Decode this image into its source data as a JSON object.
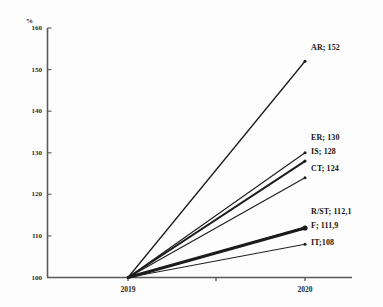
{
  "chart_data": {
    "type": "line",
    "title": "",
    "subtitle": "",
    "xlabel": "",
    "ylabel": "%",
    "x": [
      "2019",
      "2020"
    ],
    "categories": [
      "2019",
      "2020"
    ],
    "xlim": [
      2019,
      2020
    ],
    "ylim": [
      100,
      160
    ],
    "yticks": [
      100,
      110,
      120,
      130,
      140,
      150,
      160
    ],
    "ytick_labels": [
      "100",
      "110",
      "120",
      "130",
      "140",
      "150",
      "160"
    ],
    "xtick_labels": [
      "2019",
      "2020"
    ],
    "grid": false,
    "legend": "right-endpoint-labels",
    "base_index_value": 100,
    "series": [
      {
        "name": "AR",
        "label": "AR; 152",
        "values": [
          100,
          152
        ],
        "end_value": 152,
        "emphasis": "normal"
      },
      {
        "name": "ER",
        "label": "ER; 130",
        "values": [
          100,
          130
        ],
        "end_value": 130,
        "emphasis": "normal"
      },
      {
        "name": "IS",
        "label": "IS; 128",
        "values": [
          100,
          128
        ],
        "end_value": 128,
        "emphasis": "bold"
      },
      {
        "name": "CT",
        "label": "CT; 124",
        "values": [
          100,
          124
        ],
        "end_value": 124,
        "emphasis": "normal"
      },
      {
        "name": "R/ST",
        "label": "R/ST; 112,1",
        "values": [
          100,
          112.1
        ],
        "end_value": 112.1,
        "emphasis": "normal"
      },
      {
        "name": "F",
        "label": "F; 111,9",
        "values": [
          100,
          111.9
        ],
        "end_value": 111.9,
        "emphasis": "heavy"
      },
      {
        "name": "IT",
        "label": "IT;108",
        "values": [
          100,
          108
        ],
        "end_value": 108,
        "emphasis": "normal"
      }
    ],
    "colors": {
      "line": "#1c1c1c",
      "axis": "#5a5a5a",
      "text": "#1a1a1a",
      "background": "#fdfdfd"
    }
  },
  "axis": {
    "unit": "%",
    "y_ticks": [
      "160",
      "150",
      "140",
      "130",
      "120",
      "110",
      "100"
    ],
    "x_ticks": [
      "2019",
      "2020"
    ]
  },
  "series_labels": {
    "ar": "AR; 152",
    "er": "ER; 130",
    "is": "IS; 128",
    "ct": "CT; 124",
    "rst": "R/ST; 112,1",
    "f": "F; 111,9",
    "it": "IT;108"
  }
}
